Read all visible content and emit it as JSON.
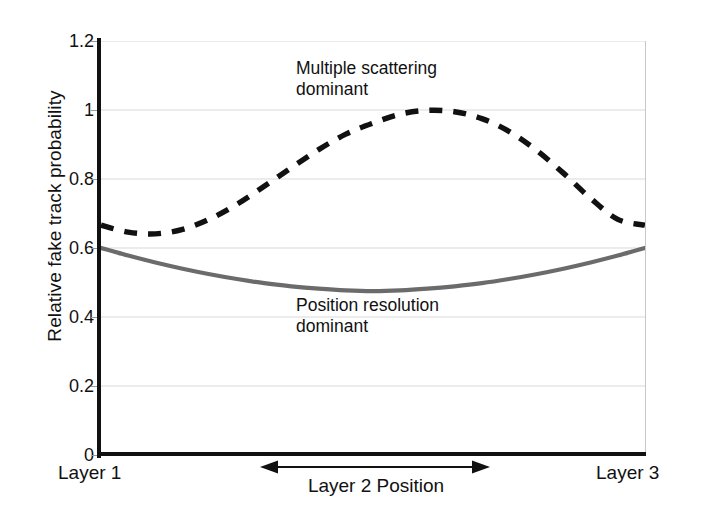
{
  "chart_data": {
    "type": "line",
    "title": "",
    "xlabel": "Layer 2 Position",
    "ylabel": "Relative fake track probability",
    "ylim": [
      0,
      1.2
    ],
    "xlim": [
      0,
      1
    ],
    "grid": true,
    "legend_position": "inline-annotations",
    "y_ticks": [
      "1.2",
      "1",
      "0.8",
      "0.6",
      "0.4",
      "0.2",
      "0"
    ],
    "y_tick_values": [
      1.2,
      1.0,
      0.8,
      0.6,
      0.4,
      0.2,
      0
    ],
    "x_category_labels": [
      "Layer 1",
      "Layer 3"
    ],
    "annotations": [
      {
        "name": "multiple-scattering-annotation",
        "text": "Multiple scattering\ndominant",
        "line1": "Multiple scattering",
        "line2": "dominant"
      },
      {
        "name": "position-resolution-annotation",
        "text": "Position resolution\ndominant",
        "line1": "Position resolution",
        "line2": "dominant"
      }
    ],
    "x": [
      0,
      0.05,
      0.1,
      0.15,
      0.2,
      0.25,
      0.3,
      0.35,
      0.4,
      0.45,
      0.5,
      0.55,
      0.6,
      0.65,
      0.7,
      0.75,
      0.8,
      0.85,
      0.9,
      0.95,
      1
    ],
    "series": [
      {
        "name": "Multiple scattering dominant",
        "style": "dashed",
        "color": "#111111",
        "values": [
          0.666,
          0.646,
          0.641,
          0.654,
          0.684,
          0.727,
          0.779,
          0.833,
          0.885,
          0.93,
          0.962,
          0.988,
          0.999,
          0.995,
          0.975,
          0.938,
          0.884,
          0.817,
          0.744,
          0.683,
          0.666
        ]
      },
      {
        "name": "Position resolution dominant",
        "style": "solid",
        "color": "#6b6b6b",
        "values": [
          0.6,
          0.578,
          0.558,
          0.54,
          0.524,
          0.51,
          0.498,
          0.489,
          0.482,
          0.477,
          0.475,
          0.477,
          0.482,
          0.489,
          0.498,
          0.51,
          0.524,
          0.54,
          0.558,
          0.578,
          0.6
        ]
      }
    ]
  },
  "axis": {
    "y_title": "Relative fake track probability",
    "x_title": "Layer 2 Position",
    "x_left_category": "Layer 1",
    "x_right_category": "Layer 3"
  },
  "colors": {
    "axis": "#111111",
    "grid": "#d9d9d9",
    "scattering_curve": "#111111",
    "resolution_curve": "#6b6b6b",
    "background": "#ffffff"
  }
}
